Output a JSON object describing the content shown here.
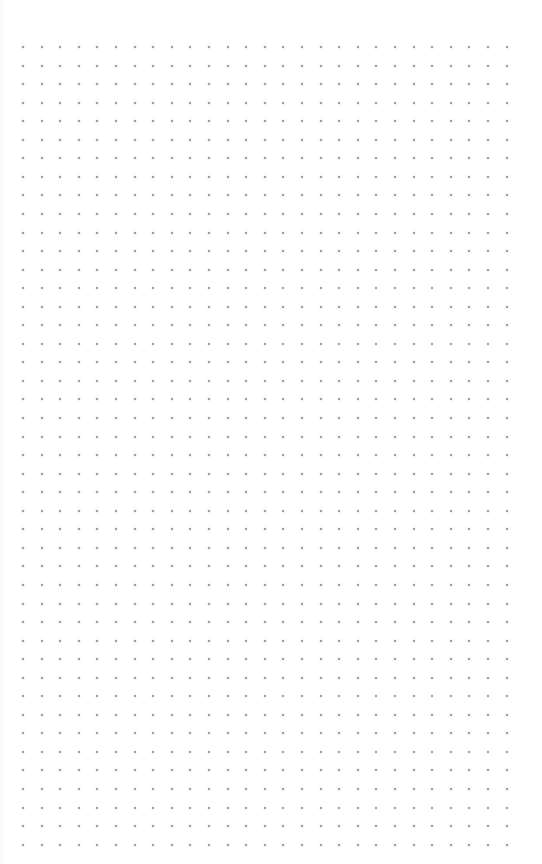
{
  "page": {
    "type": "dot-grid-paper",
    "background_color": "#ffffff",
    "dot_color": "#8a8a8a"
  },
  "grid": {
    "columns": 27,
    "rows": 44,
    "origin_x": 23,
    "origin_y": 47,
    "spacing_x": 18.6,
    "spacing_y": 18.55,
    "dot_size": 2
  }
}
